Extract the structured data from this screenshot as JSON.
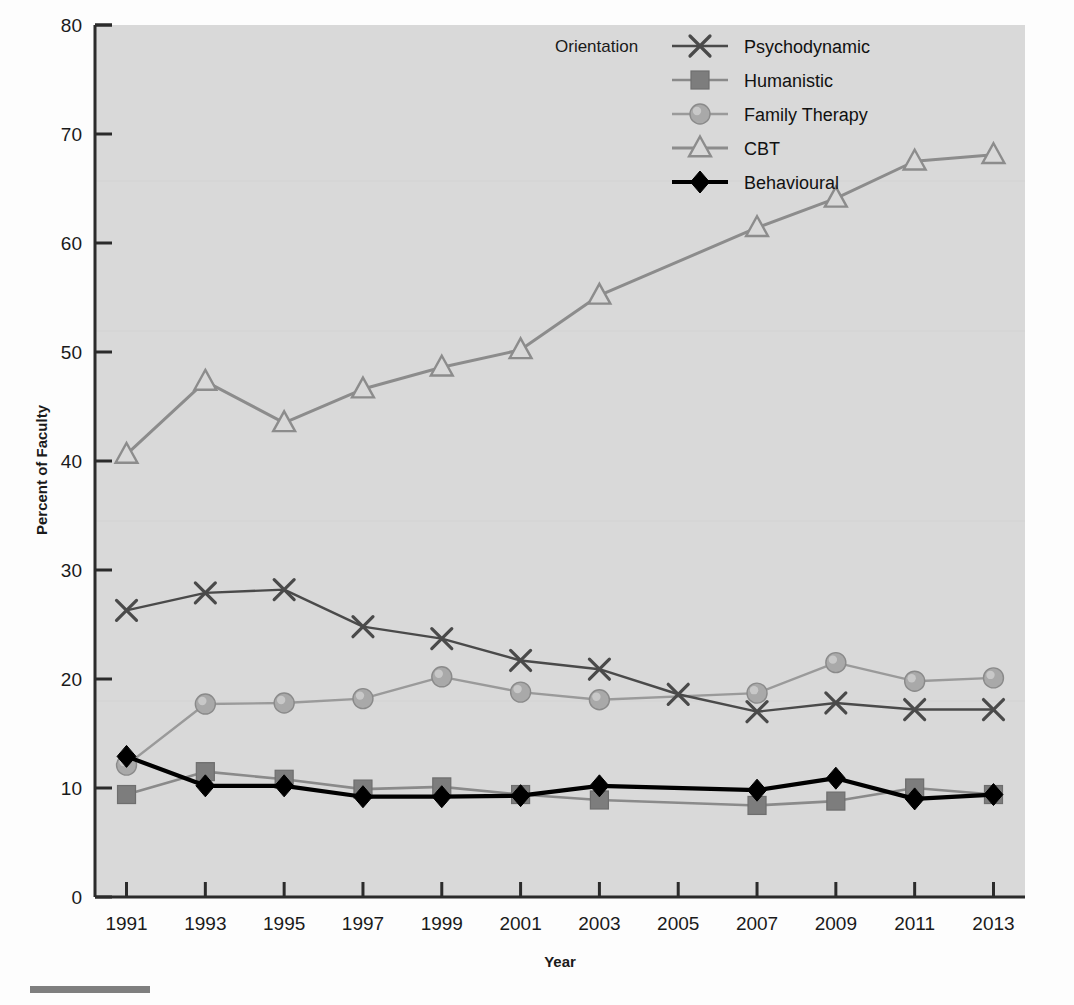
{
  "figure": {
    "background_color": "#fdfdfd",
    "plot_background_color": "#d9d9d9",
    "plot_border_color": "#2b2b2b"
  },
  "legend": {
    "title": "Orientation",
    "position": "top-right-inside",
    "entries": [
      {
        "label": "Psychodynamic",
        "marker": "cross-marker",
        "color": "#4a4a4a",
        "fill": "#4a4a4a"
      },
      {
        "label": "Humanistic",
        "marker": "square-marker",
        "color": "#8a8a8a",
        "fill": "#7d7d7d"
      },
      {
        "label": "Family Therapy",
        "marker": "circle-marker",
        "color": "#9a9a9a",
        "fill": "#a9a9a9"
      },
      {
        "label": "CBT",
        "marker": "triangle-marker",
        "color": "#8c8c8c",
        "fill": "none"
      },
      {
        "label": "Behavioural",
        "marker": "diamond-marker",
        "color": "#000000",
        "fill": "#000000"
      }
    ]
  },
  "chart_data": {
    "type": "line",
    "title": "",
    "xlabel": "Year",
    "ylabel": "Percent of Faculty",
    "x": [
      1991,
      1993,
      1995,
      1997,
      1999,
      2001,
      2003,
      2005,
      2007,
      2009,
      2011,
      2013
    ],
    "xtick_labels": [
      "1991",
      "1993",
      "1995",
      "1997",
      "1999",
      "2001",
      "2003",
      "2005",
      "2007",
      "2009",
      "2011",
      "2013"
    ],
    "ytick_labels": [
      "0",
      "10",
      "20",
      "30",
      "40",
      "50",
      "60",
      "70",
      "80"
    ],
    "xlim": [
      1990.2,
      2013.8
    ],
    "ylim": [
      0,
      80
    ],
    "ytick_step": 10,
    "grid": false,
    "series": [
      {
        "name": "Psychodynamic",
        "values": [
          26.3,
          27.9,
          28.2,
          24.8,
          23.7,
          21.7,
          20.9,
          18.6,
          17.0,
          17.8,
          17.2,
          17.2
        ]
      },
      {
        "name": "Humanistic",
        "values": [
          9.4,
          11.5,
          10.8,
          9.9,
          10.1,
          9.4,
          8.9,
          null,
          8.4,
          8.8,
          10.0,
          9.4
        ]
      },
      {
        "name": "Family Therapy",
        "values": [
          12.1,
          17.7,
          17.8,
          18.2,
          20.2,
          18.8,
          18.1,
          null,
          18.7,
          21.5,
          19.8,
          20.1
        ]
      },
      {
        "name": "CBT",
        "values": [
          40.6,
          47.3,
          43.5,
          46.6,
          48.6,
          50.2,
          55.2,
          null,
          61.4,
          64.1,
          67.5,
          68.1
        ]
      },
      {
        "name": "Behavioural",
        "values": [
          12.9,
          10.2,
          10.2,
          9.2,
          9.2,
          9.3,
          10.2,
          null,
          9.8,
          10.9,
          9.0,
          9.4
        ]
      }
    ]
  },
  "page_artifacts": {
    "ghost_text_top_left": "",
    "ghost_text_top_right": "",
    "footer_rule_visible": true
  }
}
